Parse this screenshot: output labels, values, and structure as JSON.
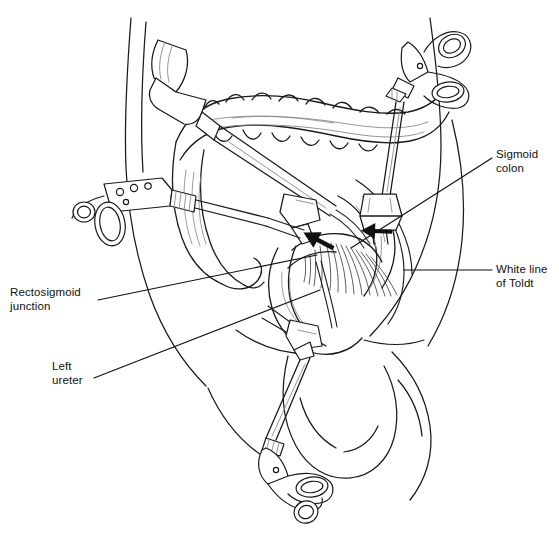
{
  "figure": {
    "kind": "medical-illustration",
    "background_color": "#ffffff",
    "line_color": "#1a1a1a",
    "shade_color": "#8a8a8a"
  },
  "labels": [
    {
      "id": "sigmoid-colon",
      "text": "Sigmoid\ncolon",
      "side": "right",
      "x": 496,
      "y": 148,
      "leader": {
        "x1": 492,
        "y1": 158,
        "x2": 351,
        "y2": 248
      }
    },
    {
      "id": "white-line-of-toldt",
      "text": "White line\nof Toldt",
      "side": "right",
      "x": 496,
      "y": 263,
      "leader": {
        "x1": 492,
        "y1": 270,
        "x2": 404,
        "y2": 270
      }
    },
    {
      "id": "rectosigmoid-junction",
      "text": "Rectosigmoid\njunction",
      "side": "left",
      "x": 10,
      "y": 286,
      "leader": {
        "x1": 98,
        "y1": 300,
        "x2": 317,
        "y2": 255
      }
    },
    {
      "id": "left-ureter",
      "text": "Left\nureter",
      "side": "left",
      "x": 52,
      "y": 360,
      "leader": {
        "x1": 94,
        "y1": 378,
        "x2": 320,
        "y2": 290
      }
    }
  ],
  "arrows": [
    {
      "id": "traction-arrow-left",
      "note": "solid black arrow, points up-left",
      "x": 313,
      "y": 240,
      "angle": -62
    },
    {
      "id": "traction-arrow-right",
      "note": "solid black arrow, points up",
      "x": 372,
      "y": 233,
      "angle": -88
    }
  ],
  "instruments": [
    {
      "id": "camera-trocar-upper-left",
      "type": "trocar-cannula-with-grip",
      "note": "upper-left cylindrical port entering abdominal wall"
    },
    {
      "id": "grasper-left",
      "type": "ring-handle-grasper",
      "note": "left lateral ring-handled laparoscopic grasper"
    },
    {
      "id": "scissors-upper-right",
      "type": "scissor-handle-instrument",
      "note": "upper-right scissor-handled instrument through trocar"
    },
    {
      "id": "scissors-lower",
      "type": "scissor-handle-instrument",
      "note": "lower midline scissor-handled instrument"
    },
    {
      "id": "trocar-port-right",
      "type": "trocar-port",
      "note": "right lower-quadrant port sleeve"
    },
    {
      "id": "trocar-port-center",
      "type": "trocar-port",
      "note": "mid-abdominal port sleeve"
    }
  ],
  "anatomy": [
    {
      "id": "transverse-colon",
      "note": "haustrated colon loop across upper abdomen"
    },
    {
      "id": "descending-colon",
      "note": "colon descending on the left toward sigmoid"
    },
    {
      "id": "sigmoid-colon",
      "note": "sigmoid loop at left lower quadrant"
    },
    {
      "id": "rectosigmoid-junction",
      "note": "junction below sigmoid loop"
    },
    {
      "id": "mesentery-hatching",
      "note": "radiating fine hatch lines of divided mesentery"
    },
    {
      "id": "left-ureter",
      "note": "slender tube in retroperitoneum"
    },
    {
      "id": "abdominal-wall",
      "note": "torso / abdominal wall contour"
    },
    {
      "id": "thigh-left",
      "note": "left thigh contour lower right"
    },
    {
      "id": "thigh-right",
      "note": "right thigh contour lower center"
    }
  ]
}
